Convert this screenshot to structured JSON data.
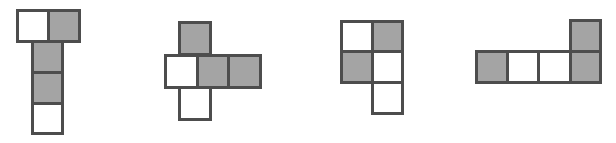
{
  "colors": {
    "shaded": "#a4a4a4",
    "unshaded": "#ffffff",
    "border": "#4d4d4d"
  },
  "shapes": [
    {
      "id": "net-1",
      "cells": [
        {
          "x": 16,
          "y": 9,
          "w": 34,
          "h": 34,
          "fill": "white"
        },
        {
          "x": 47,
          "y": 9,
          "w": 34,
          "h": 34,
          "fill": "gray"
        },
        {
          "x": 31,
          "y": 40,
          "w": 33,
          "h": 34,
          "fill": "gray"
        },
        {
          "x": 31,
          "y": 71,
          "w": 33,
          "h": 34,
          "fill": "gray"
        },
        {
          "x": 31,
          "y": 102,
          "w": 33,
          "h": 33,
          "fill": "white"
        }
      ]
    },
    {
      "id": "net-2",
      "cells": [
        {
          "x": 178,
          "y": 21,
          "w": 34,
          "h": 35,
          "fill": "gray"
        },
        {
          "x": 164,
          "y": 54,
          "w": 35,
          "h": 35,
          "fill": "white"
        },
        {
          "x": 196,
          "y": 54,
          "w": 34,
          "h": 35,
          "fill": "gray"
        },
        {
          "x": 227,
          "y": 54,
          "w": 35,
          "h": 35,
          "fill": "gray"
        },
        {
          "x": 178,
          "y": 86,
          "w": 34,
          "h": 35,
          "fill": "white"
        }
      ]
    },
    {
      "id": "net-3",
      "cells": [
        {
          "x": 340,
          "y": 20,
          "w": 34,
          "h": 33,
          "fill": "white"
        },
        {
          "x": 371,
          "y": 20,
          "w": 33,
          "h": 33,
          "fill": "gray"
        },
        {
          "x": 340,
          "y": 50,
          "w": 34,
          "h": 34,
          "fill": "gray"
        },
        {
          "x": 371,
          "y": 50,
          "w": 33,
          "h": 34,
          "fill": "white"
        },
        {
          "x": 371,
          "y": 81,
          "w": 33,
          "h": 34,
          "fill": "white"
        }
      ]
    },
    {
      "id": "net-4",
      "cells": [
        {
          "x": 569,
          "y": 19,
          "w": 33,
          "h": 34,
          "fill": "gray"
        },
        {
          "x": 475,
          "y": 50,
          "w": 34,
          "h": 34,
          "fill": "gray"
        },
        {
          "x": 506,
          "y": 50,
          "w": 34,
          "h": 34,
          "fill": "white"
        },
        {
          "x": 537,
          "y": 50,
          "w": 35,
          "h": 34,
          "fill": "white"
        },
        {
          "x": 569,
          "y": 50,
          "w": 33,
          "h": 34,
          "fill": "gray"
        }
      ]
    }
  ]
}
